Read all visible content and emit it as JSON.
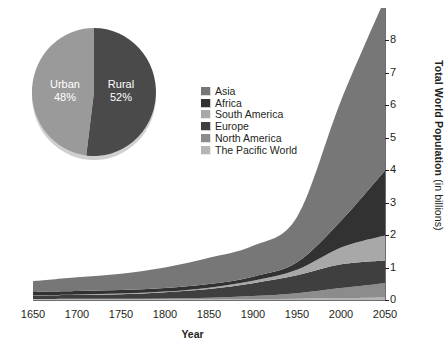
{
  "chart_data": {
    "type": "area",
    "stacked": true,
    "title": "",
    "xlabel": "Year",
    "ylabel": "Total World Population (in billions)",
    "ylabel_main": "Total World Population",
    "ylabel_unit": "(in billions)",
    "x": [
      1650,
      1700,
      1750,
      1800,
      1850,
      1900,
      1950,
      2000,
      2050
    ],
    "xtick_labels": [
      "1650",
      "1700",
      "1750",
      "1800",
      "1850",
      "1900",
      "1950",
      "2000",
      "2050"
    ],
    "xlim": [
      1650,
      2050
    ],
    "ylim": [
      0,
      9
    ],
    "ytick_labels": [
      "0",
      "1",
      "2",
      "3",
      "4",
      "5",
      "6",
      "7",
      "8"
    ],
    "yticks": [
      0,
      1,
      2,
      3,
      4,
      5,
      6,
      7,
      8
    ],
    "y_axis_position": "right",
    "grid": false,
    "legend_position": "center",
    "stack_order_bottom_to_top": [
      "The Pacific World",
      "North America",
      "Europe",
      "South America",
      "Africa",
      "Asia"
    ],
    "series": [
      {
        "name": "The Pacific World",
        "color": "#b5b5b5",
        "values": [
          0.02,
          0.02,
          0.02,
          0.02,
          0.02,
          0.03,
          0.04,
          0.06,
          0.08
        ]
      },
      {
        "name": "North America",
        "color": "#8c8c8c",
        "values": [
          0.01,
          0.02,
          0.02,
          0.03,
          0.05,
          0.09,
          0.17,
          0.31,
          0.44
        ]
      },
      {
        "name": "Europe",
        "color": "#3f3f3f",
        "values": [
          0.1,
          0.12,
          0.14,
          0.19,
          0.27,
          0.4,
          0.55,
          0.73,
          0.7
        ]
      },
      {
        "name": "South America",
        "color": "#a8a8a8",
        "values": [
          0.01,
          0.01,
          0.02,
          0.02,
          0.04,
          0.07,
          0.17,
          0.52,
          0.77
        ]
      },
      {
        "name": "Africa",
        "color": "#323232",
        "values": [
          0.11,
          0.11,
          0.11,
          0.11,
          0.11,
          0.13,
          0.23,
          0.82,
          2.0
        ]
      },
      {
        "name": "Asia",
        "color": "#777777",
        "values": [
          0.33,
          0.42,
          0.5,
          0.63,
          0.81,
          0.95,
          1.4,
          3.7,
          5.3
        ]
      }
    ],
    "totals": [
      0.58,
      0.7,
      0.81,
      1.0,
      1.3,
      1.67,
      2.56,
      6.14,
      9.29
    ]
  },
  "pie_chart": {
    "type": "pie",
    "slices": [
      {
        "label": "Urban",
        "percent_label": "48%",
        "value": 48,
        "color": "#9a9a9a"
      },
      {
        "label": "Rural",
        "percent_label": "52%",
        "value": 52,
        "color": "#4a4a4a"
      }
    ]
  },
  "legend": {
    "items": [
      {
        "label": "Asia",
        "color": "#777777"
      },
      {
        "label": "Africa",
        "color": "#323232"
      },
      {
        "label": "South America",
        "color": "#a8a8a8"
      },
      {
        "label": "Europe",
        "color": "#3f3f3f"
      },
      {
        "label": "North America",
        "color": "#8c8c8c"
      },
      {
        "label": "The Pacific World",
        "color": "#b5b5b5"
      }
    ]
  }
}
